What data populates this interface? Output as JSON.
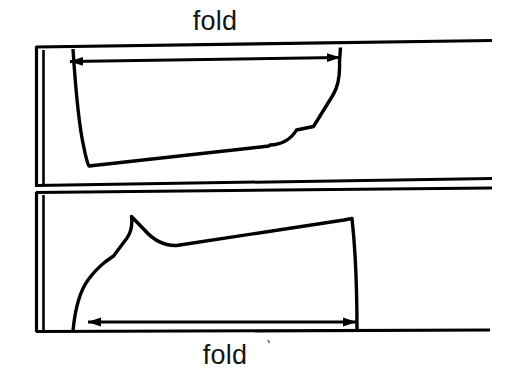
{
  "figure": {
    "type": "technical-line-diagram",
    "background_color": "#ffffff",
    "line_color": "#000000",
    "canvas": {
      "width": 515,
      "height": 380
    }
  },
  "labels": {
    "fold_top": "fold",
    "fold_bottom": "fold"
  },
  "annotations": {
    "top_arrow": {
      "name": "top-dimension-arrow",
      "style": "double-headed",
      "x1": 70,
      "y1": 61,
      "x2": 340,
      "y2": 58
    },
    "bottom_arrow": {
      "name": "bottom-dimension-arrow",
      "style": "double-headed",
      "x1": 88,
      "y1": 322,
      "x2": 356,
      "y2": 322
    }
  },
  "geometry": {
    "selvage_top": "M 36,47 L 492,40",
    "selvage_mid_upper": "M 36,185 L 492,178",
    "selvage_mid_lower": "M 36,192 L 492,188",
    "selvage_bottom": "M 36,332 L 490,330",
    "fold_spine_outer_top": "M 36,47 L 36,186",
    "fold_spine_inner_top": "M 43,49 L 43,186",
    "fold_spine_outer_bottom": "M 36,192 L 36,332",
    "fold_spine_inner_bottom": "M 43,194 L 43,331",
    "piece_top": "M 73,48 C 76,92 80,124 89,164 L 268,146 C 280,146 291,141 296,130 L 314,126 L 338,92 C 343,82 344,70 343,56 L 341,47",
    "piece_bottom": "M 73,331 C 79,300 85,284 95,274 L 112,258 L 128,236 C 133,228 133,222 132,216 L 145,231 C 153,240 164,246 176,246 L 345,220 L 352,218 C 355,250 357,280 357,331"
  }
}
